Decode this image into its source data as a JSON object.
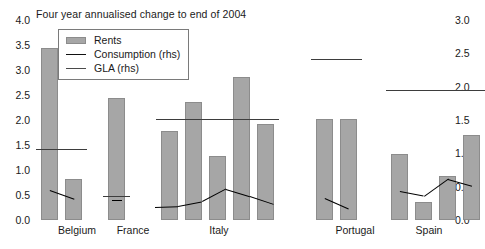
{
  "chart_data": {
    "type": "bar",
    "title": "Four year annualised change to end of 2004",
    "xlabel": "",
    "ylabel": "",
    "ylim": [
      0,
      4.0
    ],
    "y2lim": [
      0,
      3.0
    ],
    "grid": false,
    "legend_position": "top-left",
    "left_axis_ticks": [
      "0.0",
      "0.5",
      "1.0",
      "1.5",
      "2.0",
      "2.5",
      "3.0",
      "3.5",
      "4.0"
    ],
    "right_axis_ticks": [
      "0.0",
      "0.5",
      "1.0",
      "1.5",
      "2.0",
      "2.5",
      "3.0"
    ],
    "categories": [
      "Belgium",
      "France",
      "Italy",
      "Portugal",
      "Spain"
    ],
    "legend": [
      {
        "label": "Rents",
        "key": "swatch"
      },
      {
        "label": "Consumption (rhs)",
        "key": "line"
      },
      {
        "label": "GLA (rhs)",
        "key": "line-gla"
      }
    ],
    "groups": [
      {
        "name": "Belgium",
        "rents": [
          3.45,
          0.82
        ],
        "gla_rhs": [
          1.07,
          1.07
        ],
        "consumption_rhs": [
          0.45,
          0.32
        ]
      },
      {
        "name": "France",
        "rents": [
          2.45
        ],
        "gla_rhs": [
          0.36
        ],
        "consumption_rhs": [
          0.3
        ]
      },
      {
        "name": "Italy",
        "rents": [
          1.78,
          2.37,
          1.29,
          2.87,
          1.92
        ],
        "gla_rhs": [
          1.52,
          1.52,
          1.52,
          1.52,
          1.52
        ],
        "consumption_rhs": [
          0.2,
          0.21,
          0.28,
          0.47,
          0.36,
          0.24
        ]
      },
      {
        "name": "Portugal",
        "rents": [
          2.02,
          2.02
        ],
        "gla_rhs": [
          2.41,
          2.41
        ],
        "consumption_rhs": [
          0.33,
          0.17
        ]
      },
      {
        "name": "Spain",
        "rents": [
          1.33,
          0.37,
          0.88,
          1.7
        ],
        "gla_rhs": [
          1.95,
          1.95
        ],
        "consumption_rhs": [
          0.43,
          0.36,
          0.62,
          0.52
        ]
      }
    ]
  },
  "layout": {
    "plot_left": 33,
    "plot_top": 20,
    "plot_width": 419,
    "plot_height": 200,
    "bar_width": 17,
    "group_starts": [
      8,
      75,
      128,
      283,
      358
    ],
    "bar_pitch": 24,
    "group_label_centers": [
      44,
      100,
      186,
      322,
      396
    ]
  }
}
